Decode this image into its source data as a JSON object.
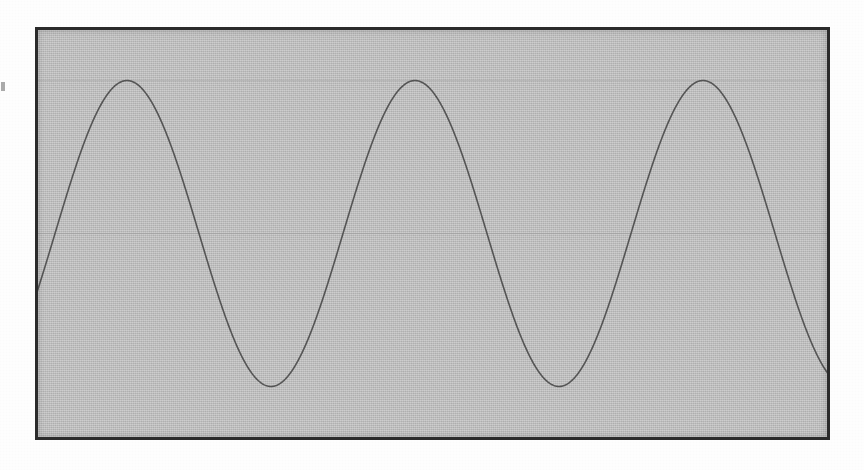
{
  "figure": {
    "caption": "",
    "background_color": "#ffffff",
    "plot_background_color": "#bdbdbd",
    "frame_color": "#2b2b2b",
    "curve_color": "#555555",
    "gridline_color": "#a9a9a9",
    "frame": {
      "x": 35,
      "y": 27,
      "width": 795,
      "height": 413,
      "border_width": 3
    }
  },
  "artifacts": {
    "left_edge_mark": "scan-speck"
  },
  "chart_data": {
    "type": "line",
    "title": "",
    "subtitle": "",
    "xlabel": "",
    "ylabel": "",
    "legend": [],
    "legend_position": "none",
    "grid": true,
    "gridlines_y": [
      1,
      0
    ],
    "axis_ticks_x": [],
    "axis_ticks_y": [],
    "xlim": [
      -0.0695,
      2.691
    ],
    "ylim": [
      -1.35,
      1.35
    ],
    "series": [
      {
        "name": "sine",
        "function": "sin(2*pi*x)",
        "amplitude": 1.0,
        "period": 1.0,
        "phase_cycles": 0.0,
        "color": "#555555",
        "line_width": 1.6,
        "x": [
          -0.0695,
          0.0,
          0.0625,
          0.125,
          0.1875,
          0.25,
          0.3125,
          0.375,
          0.4375,
          0.5,
          0.5625,
          0.625,
          0.6875,
          0.75,
          0.8125,
          0.875,
          0.9375,
          1.0,
          1.0625,
          1.125,
          1.1875,
          1.25,
          1.3125,
          1.375,
          1.4375,
          1.5,
          1.5625,
          1.625,
          1.6875,
          1.75,
          1.8125,
          1.875,
          1.9375,
          2.0,
          2.0625,
          2.125,
          2.1875,
          2.25,
          2.3125,
          2.375,
          2.4375,
          2.5,
          2.5625,
          2.625,
          2.6875,
          2.691
        ],
        "y": [
          -0.4258,
          0.0,
          0.3827,
          0.7071,
          0.9239,
          1.0,
          0.9239,
          0.7071,
          0.3827,
          0.0,
          -0.3827,
          -0.7071,
          -0.9239,
          -1.0,
          -0.9239,
          -0.7071,
          -0.3827,
          0.0,
          0.3827,
          0.7071,
          0.9239,
          1.0,
          0.9239,
          0.7071,
          0.3827,
          0.0,
          -0.3827,
          -0.7071,
          -0.9239,
          -1.0,
          -0.9239,
          -0.7071,
          -0.3827,
          0.0,
          0.3827,
          0.7071,
          0.9239,
          1.0,
          0.9239,
          0.7071,
          0.3827,
          0.0,
          -0.3827,
          -0.7071,
          -0.9239,
          -0.9412
        ],
        "peaks_px": [
          {
            "x": 105,
            "y": 133
          },
          {
            "x": 392,
            "y": 133
          },
          {
            "x": 682,
            "y": 133
          }
        ],
        "troughs_px": [
          {
            "x": 252,
            "y": 338
          },
          {
            "x": 540,
            "y": 338
          }
        ],
        "midline_px_y": 236,
        "start_px": {
          "x": 38,
          "y": 228
        },
        "end_px": {
          "x": 827,
          "y": 339
        }
      }
    ]
  }
}
